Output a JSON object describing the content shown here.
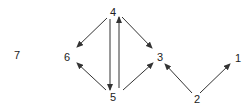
{
  "diagram": {
    "type": "directed-graph",
    "nodes": [
      {
        "id": "1",
        "label": "1",
        "x": 238,
        "y": 58
      },
      {
        "id": "2",
        "label": "2",
        "x": 197,
        "y": 99
      },
      {
        "id": "3",
        "label": "3",
        "x": 160,
        "y": 57
      },
      {
        "id": "4",
        "label": "4",
        "x": 113,
        "y": 12
      },
      {
        "id": "5",
        "label": "5",
        "x": 113,
        "y": 97
      },
      {
        "id": "6",
        "label": "6",
        "x": 67,
        "y": 57
      },
      {
        "id": "7",
        "label": "7",
        "x": 17,
        "y": 55
      }
    ],
    "edges": [
      {
        "from": "4",
        "to": "6",
        "x1": 107,
        "y1": 18,
        "x2": 77,
        "y2": 47
      },
      {
        "from": "4",
        "to": "5",
        "x1": 110,
        "y1": 19,
        "x2": 110,
        "y2": 90
      },
      {
        "from": "5",
        "to": "4",
        "x1": 119,
        "y1": 88,
        "x2": 119,
        "y2": 17
      },
      {
        "from": "4",
        "to": "3",
        "x1": 122,
        "y1": 17,
        "x2": 152,
        "y2": 48
      },
      {
        "from": "5",
        "to": "6",
        "x1": 106,
        "y1": 90,
        "x2": 77,
        "y2": 63
      },
      {
        "from": "5",
        "to": "3",
        "x1": 123,
        "y1": 90,
        "x2": 153,
        "y2": 63
      },
      {
        "from": "2",
        "to": "3",
        "x1": 192,
        "y1": 93,
        "x2": 165,
        "y2": 64
      },
      {
        "from": "2",
        "to": "1",
        "x1": 200,
        "y1": 93,
        "x2": 230,
        "y2": 64
      }
    ],
    "colors": {
      "edge": "#333333",
      "label": "#222222",
      "background": "#ffffff"
    }
  }
}
